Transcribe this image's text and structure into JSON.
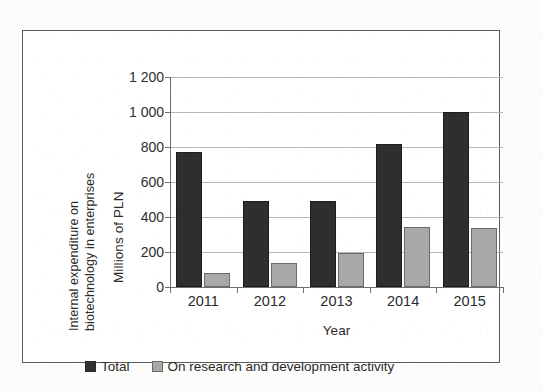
{
  "chart_data": {
    "type": "bar",
    "title": "",
    "subtitle": "",
    "categories": [
      "2011",
      "2012",
      "2013",
      "2014",
      "2015"
    ],
    "series": [
      {
        "name": "Total",
        "values": [
          770,
          490,
          490,
          820,
          1000
        ],
        "color": "#2e2e2e"
      },
      {
        "name": "On research and development activity",
        "values": [
          80,
          135,
          195,
          345,
          340
        ],
        "color": "#a9a9a9"
      }
    ],
    "xlabel": "Year",
    "ylabel": "Millions of PLN",
    "y_axis_title_lines": [
      "Internal expenditure on",
      "biotechnology in enterprises"
    ],
    "ylim": [
      0,
      1200
    ],
    "ytick_values": [
      0,
      200,
      400,
      600,
      800,
      1000,
      1200
    ],
    "ytick_labels": [
      "0",
      "200",
      "400",
      "600",
      "800",
      "1 000",
      "1 200"
    ],
    "grid": true,
    "grid_axis": "y",
    "legend_position": "bottom-left",
    "annotations": []
  },
  "axis": {
    "y_title_line1": "Internal expenditure on",
    "y_title_line2": "biotechnology in enterprises",
    "y_unit": "Millions of PLN",
    "x_title": "Year"
  },
  "legend": {
    "items": [
      {
        "label": "Total",
        "swatch": "dark-square-swatch"
      },
      {
        "label": "On research and development activity",
        "swatch": "gray-square-swatch"
      }
    ]
  },
  "colors": {
    "series_total": "#2e2e2e",
    "series_rnd": "#a9a9a9",
    "gridline": "#b7b7b7",
    "axis": "#6f6f6f",
    "frame": "#5d5d5d",
    "text": "#2b2b2b",
    "background": "#ffffff"
  }
}
